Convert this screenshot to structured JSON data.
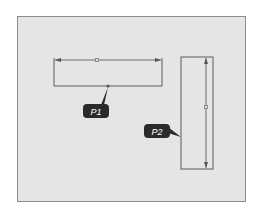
{
  "diagram": {
    "type": "cad-sketch",
    "colors": {
      "background": "#ffffff",
      "panel_fill": "#e5e5e5",
      "panel_border": "#8c8c8c",
      "sketch_line": "#555555",
      "dimension_line": "#6a6a6a",
      "callout_fill": "#2a2a2a",
      "callout_text": "#ffffff"
    },
    "shapes": [
      {
        "id": "horizontal-rectangle",
        "x": 54,
        "y": 59,
        "width": 108,
        "height": 27,
        "open_top": true
      },
      {
        "id": "vertical-rectangle",
        "x": 181,
        "y": 57,
        "width": 32,
        "height": 112
      }
    ],
    "dimensions": [
      {
        "id": "horizontal-dimension",
        "orientation": "horizontal",
        "from": [
          54,
          60
        ],
        "to": [
          162,
          60
        ],
        "midpoint_marker": [
          97,
          60
        ]
      },
      {
        "id": "vertical-dimension",
        "orientation": "vertical",
        "from": [
          206,
          57
        ],
        "to": [
          206,
          169
        ],
        "midpoint_marker": [
          206,
          107
        ]
      }
    ],
    "callouts": [
      {
        "id": "P1",
        "label": "P1",
        "box": {
          "x": 83,
          "y": 104,
          "width": 26,
          "height": 14
        },
        "pointer_to": [
          108,
          86
        ]
      },
      {
        "id": "P2",
        "label": "P2",
        "box": {
          "x": 144,
          "y": 124,
          "width": 26,
          "height": 14
        },
        "pointer_to": [
          181,
          137
        ]
      }
    ]
  }
}
